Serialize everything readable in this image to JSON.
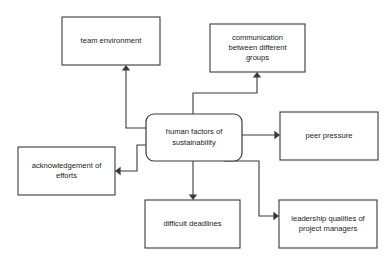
{
  "diagram": {
    "type": "hub-and-spoke concept map",
    "colors": {
      "background": "#ffffff",
      "stroke": "#3a3a3a",
      "text": "#1a1a1a",
      "node_fill": "#ffffff"
    },
    "central_node": {
      "id": "central",
      "lines": [
        "human factors of",
        "sustainability"
      ],
      "shape": "rounded-rectangle",
      "x": 146,
      "y": 114,
      "width": 96,
      "height": 47,
      "radius": 8
    },
    "nodes": [
      {
        "id": "team-environment",
        "lines": [
          "team environment"
        ],
        "shape": "rectangle",
        "x": 62,
        "y": 17,
        "width": 98,
        "height": 48
      },
      {
        "id": "communication-between-different-groups",
        "lines": [
          "communication",
          "between different",
          "groups"
        ],
        "shape": "rectangle",
        "x": 210,
        "y": 24,
        "width": 95,
        "height": 48
      },
      {
        "id": "peer-pressure",
        "lines": [
          "peer pressure"
        ],
        "shape": "rectangle",
        "x": 280,
        "y": 112,
        "width": 98,
        "height": 48
      },
      {
        "id": "acknowledgement-of-efforts",
        "lines": [
          "acknowledgement of",
          "efforts"
        ],
        "shape": "rectangle",
        "x": 18,
        "y": 147,
        "width": 97,
        "height": 48
      },
      {
        "id": "difficult-deadlines",
        "lines": [
          "difficult deadlines"
        ],
        "shape": "rectangle",
        "x": 145,
        "y": 200,
        "width": 95,
        "height": 48
      },
      {
        "id": "leadership-qualities-of-project-managers",
        "lines": [
          "leadership qualities of",
          "project managers"
        ],
        "shape": "rectangle",
        "x": 279,
        "y": 200,
        "width": 98,
        "height": 48
      }
    ],
    "connectors": [
      {
        "id": "central-to-team-environment",
        "from": "central",
        "to": "team-environment",
        "path": "M 146 128 L 126 128 L 126 70",
        "arrow": {
          "x": 126,
          "y": 65,
          "dir": "up"
        }
      },
      {
        "id": "central-to-communication",
        "from": "central",
        "to": "communication-between-different-groups",
        "path": "M 193 114 L 193 93 L 257 93 L 257 77",
        "arrow": {
          "x": 257,
          "y": 72,
          "dir": "up"
        }
      },
      {
        "id": "central-to-peer-pressure",
        "from": "central",
        "to": "peer-pressure",
        "path": "M 242 135 L 275 135",
        "arrow": {
          "x": 280,
          "y": 135,
          "dir": "right"
        }
      },
      {
        "id": "central-to-acknowledgement",
        "from": "central",
        "to": "acknowledgement-of-efforts",
        "path": "M 146 145 L 137 145 L 137 171 L 120 171",
        "arrow": {
          "x": 115,
          "y": 171,
          "dir": "left"
        }
      },
      {
        "id": "central-to-difficult-deadlines",
        "from": "central",
        "to": "difficult-deadlines",
        "path": "M 193 161 L 193 195",
        "arrow": {
          "x": 193,
          "y": 200,
          "dir": "down"
        }
      },
      {
        "id": "central-to-leadership-qualities",
        "from": "central",
        "to": "leadership-qualities-of-project-managers",
        "path": "M 224 161 L 259 161 L 259 216 L 274 216",
        "arrow": {
          "x": 279,
          "y": 216,
          "dir": "right"
        }
      }
    ]
  }
}
